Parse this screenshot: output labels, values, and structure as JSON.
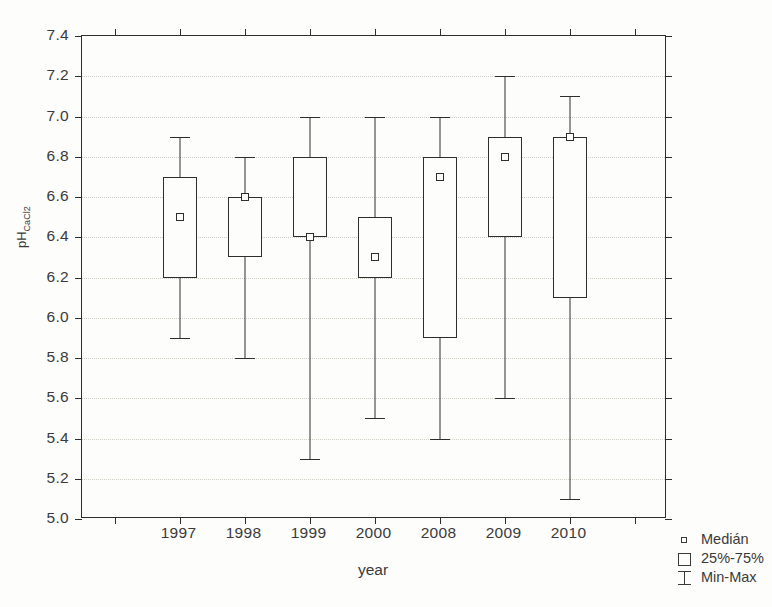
{
  "chart_data": {
    "type": "box",
    "title": "",
    "xlabel": "year",
    "ylabel": "pH",
    "ylabel_sub": "CaCl2",
    "categories": [
      "1997",
      "1998",
      "1999",
      "2000",
      "2008",
      "2009",
      "2010"
    ],
    "ylim": [
      5.0,
      7.4
    ],
    "ytick_labels": [
      "7.4",
      "7.2",
      "7.0",
      "6.8",
      "6.6",
      "6.4",
      "6.2",
      "6.0",
      "5.8",
      "5.6",
      "5.4",
      "5.2",
      "5.0"
    ],
    "ytick_values": [
      7.4,
      7.2,
      7.0,
      6.8,
      6.6,
      6.4,
      6.2,
      6.0,
      5.8,
      5.6,
      5.4,
      5.2,
      5.0
    ],
    "grid": true,
    "legend_position": "bottom-right",
    "boxes": [
      {
        "category": "1997",
        "min": 5.9,
        "q1": 6.2,
        "median": 6.5,
        "q3": 6.7,
        "max": 6.9
      },
      {
        "category": "1998",
        "min": 5.8,
        "q1": 6.3,
        "median": 6.6,
        "q3": 6.6,
        "max": 6.8
      },
      {
        "category": "1999",
        "min": 5.3,
        "q1": 6.4,
        "median": 6.4,
        "q3": 6.8,
        "max": 7.0
      },
      {
        "category": "2000",
        "min": 5.5,
        "q1": 6.2,
        "median": 6.3,
        "q3": 6.5,
        "max": 7.0
      },
      {
        "category": "2008",
        "min": 5.4,
        "q1": 5.9,
        "median": 6.7,
        "q3": 6.8,
        "max": 7.0
      },
      {
        "category": "2009",
        "min": 5.6,
        "q1": 6.4,
        "median": 6.8,
        "q3": 6.9,
        "max": 7.2
      },
      {
        "category": "2010",
        "min": 5.1,
        "q1": 6.1,
        "median": 6.9,
        "q3": 6.9,
        "max": 7.1
      }
    ],
    "legend": [
      {
        "symbol": "median-marker-icon",
        "label": "Medián"
      },
      {
        "symbol": "box-icon",
        "label": "25%-75%"
      },
      {
        "symbol": "whisker-icon",
        "label": "Min-Max"
      }
    ],
    "colors": {
      "background": "#fdfdfb",
      "axis": "#2e2e2e",
      "grid": "#cfcfc8",
      "text": "#3a3a3a"
    }
  }
}
